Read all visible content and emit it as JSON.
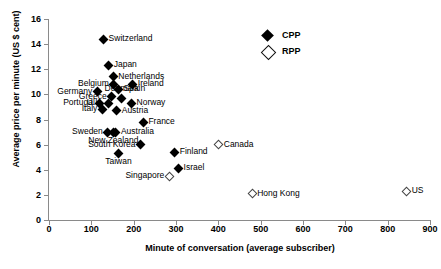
{
  "chart_data": {
    "type": "scatter",
    "title": "",
    "xlabel": "Minute of conversation (average subscriber)",
    "ylabel": "Average price per minute (US $ cent)",
    "xlim": [
      0,
      900
    ],
    "ylim": [
      0,
      16
    ],
    "xticks": [
      0,
      100,
      200,
      300,
      400,
      500,
      600,
      700,
      800,
      900
    ],
    "yticks": [
      0,
      2,
      4,
      6,
      8,
      10,
      12,
      14,
      16
    ],
    "grid": false,
    "legend_position": "top-right",
    "series": [
      {
        "name": "CPP",
        "marker": "filled-diamond",
        "color": "#000000",
        "points": [
          {
            "label": "Switzerland",
            "x": 129,
            "y": 14.4,
            "label_pos": "right"
          },
          {
            "label": "Japan",
            "x": 141,
            "y": 12.3,
            "label_pos": "right"
          },
          {
            "label": "Netherlands",
            "x": 152,
            "y": 11.4,
            "label_pos": "right"
          },
          {
            "label": "Belgium",
            "x": 153,
            "y": 10.8,
            "label_pos": "left"
          },
          {
            "label": "Ireland",
            "x": 198,
            "y": 10.8,
            "label_pos": "right"
          },
          {
            "label": "Spain",
            "x": 164,
            "y": 10.4,
            "label_pos": "right"
          },
          {
            "label": "Germany",
            "x": 114,
            "y": 10.2,
            "label_pos": "left"
          },
          {
            "label": "Greece",
            "x": 148,
            "y": 9.8,
            "label_pos": "left"
          },
          {
            "label": "Denmark",
            "x": 172,
            "y": 9.7,
            "label_pos": "above"
          },
          {
            "label": "Portugal",
            "x": 120,
            "y": 9.3,
            "label_pos": "left"
          },
          {
            "label": "U.K.",
            "x": 140,
            "y": 9.3,
            "label_pos": "left"
          },
          {
            "label": "Norway",
            "x": 195,
            "y": 9.3,
            "label_pos": "right"
          },
          {
            "label": "Italy",
            "x": 126,
            "y": 8.8,
            "label_pos": "left"
          },
          {
            "label": "Austria",
            "x": 160,
            "y": 8.7,
            "label_pos": "right"
          },
          {
            "label": "France",
            "x": 223,
            "y": 7.8,
            "label_pos": "right"
          },
          {
            "label": "Sweden",
            "x": 139,
            "y": 7.0,
            "label_pos": "left"
          },
          {
            "label": "New Zealand",
            "x": 152,
            "y": 7.0,
            "label_pos": "below"
          },
          {
            "label": "Australia",
            "x": 158,
            "y": 7.0,
            "label_pos": "right"
          },
          {
            "label": "South Korea",
            "x": 216,
            "y": 6.0,
            "label_pos": "left"
          },
          {
            "label": "Finland",
            "x": 297,
            "y": 5.4,
            "label_pos": "right"
          },
          {
            "label": "Taiwan",
            "x": 164,
            "y": 5.3,
            "label_pos": "below"
          },
          {
            "label": "Israel",
            "x": 306,
            "y": 4.1,
            "label_pos": "right"
          }
        ]
      },
      {
        "name": "RPP",
        "marker": "open-diamond",
        "color": "#ffffff",
        "points": [
          {
            "label": "Canada",
            "x": 401,
            "y": 6.0,
            "label_pos": "right"
          },
          {
            "label": "Singapore",
            "x": 284,
            "y": 3.5,
            "label_pos": "left"
          },
          {
            "label": "Hong Kong",
            "x": 480,
            "y": 2.1,
            "label_pos": "right"
          },
          {
            "label": "US",
            "x": 845,
            "y": 2.3,
            "label_pos": "right"
          }
        ]
      }
    ]
  },
  "legend": {
    "items": [
      {
        "label": "CPP",
        "marker": "filled-diamond"
      },
      {
        "label": "RPP",
        "marker": "open-diamond"
      }
    ]
  }
}
